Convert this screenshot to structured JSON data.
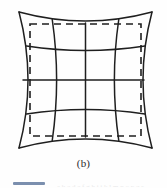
{
  "figure": {
    "caption": "(b)",
    "distortion_type": "pincushion",
    "background_color": "#fefefe",
    "grid_line_color": "#1f1f1f",
    "dashed_rect_color": "#1f1f1f",
    "grid_line_width": 1.5,
    "dashed_rect_line_width": 1.6,
    "dash_pattern": "7 5"
  },
  "chart_data": {
    "type": "line",
    "title": "(b)",
    "subtitle": "",
    "xlabel": "",
    "ylabel": "",
    "grid": true,
    "legend_position": "none",
    "xlim": [
      0,
      167
    ],
    "ylim": [
      0,
      155
    ],
    "tick_labels_x": [],
    "tick_labels_y": [],
    "annotations": [
      "(b)"
    ],
    "grid_divisions": 4,
    "grid_lines_per_axis": 5,
    "distortion": {
      "model": "pincushion",
      "bow_direction": "inward",
      "max_bow_px": 7.5,
      "corner_points": {
        "top_left": [
          19,
          12
        ],
        "top_right": [
          152,
          12
        ],
        "bottom_right": [
          152,
          148
        ],
        "bottom_left": [
          19,
          148
        ]
      },
      "edge_midpoints": {
        "top": [
          85.5,
          21
        ],
        "right": [
          144,
          80
        ],
        "bottom": [
          85.5,
          139
        ],
        "left": [
          27,
          80
        ]
      }
    },
    "reference_rect": {
      "x": 30,
      "y": 24,
      "width": 111,
      "height": 112,
      "style": "dashed"
    },
    "series": [
      {
        "name": "distorted-vertical-lines",
        "count": 5,
        "values": [
          19,
          52.25,
          85.5,
          118.75,
          152
        ]
      },
      {
        "name": "distorted-horizontal-lines",
        "count": 5,
        "values": [
          12,
          46,
          80,
          114,
          148
        ]
      }
    ]
  },
  "page_bleed": {
    "rule_color": "#7b8fae",
    "ghost_text": "a b c  d e f g h  i j k  l m n  o p q r"
  }
}
